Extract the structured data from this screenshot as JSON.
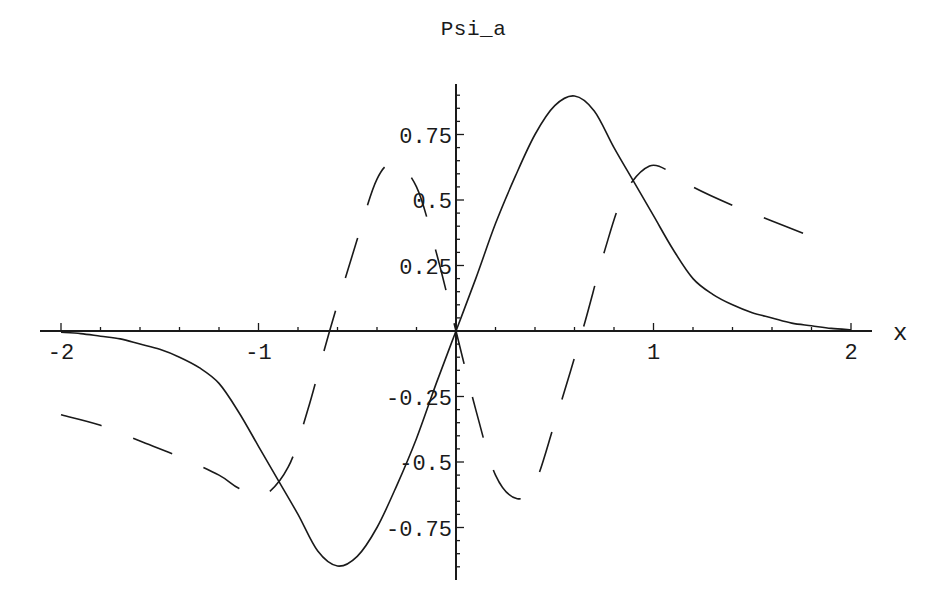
{
  "chart_data": {
    "type": "line",
    "title": "Psi_a",
    "xlabel": "x",
    "ylabel": "",
    "xlim": [
      -2.1,
      2.1
    ],
    "ylim": [
      -0.91,
      0.94
    ],
    "grid": false,
    "legend": null,
    "x_ticks": [
      {
        "value": -2,
        "label": "-2"
      },
      {
        "value": -1,
        "label": "-1"
      },
      {
        "value": 1,
        "label": "1"
      },
      {
        "value": 2,
        "label": "2"
      }
    ],
    "y_ticks": [
      {
        "value": 0.75,
        "label": "0.75"
      },
      {
        "value": 0.5,
        "label": "0.5"
      },
      {
        "value": 0.25,
        "label": "0.25"
      },
      {
        "value": -0.25,
        "label": "-0.25"
      },
      {
        "value": -0.5,
        "label": "-0.5"
      },
      {
        "value": -0.75,
        "label": "-0.75"
      }
    ],
    "series": [
      {
        "name": "solid",
        "style": "solid",
        "x": [
          -2.0,
          -1.9,
          -1.8,
          -1.7,
          -1.6,
          -1.5,
          -1.4,
          -1.3,
          -1.2,
          -1.1,
          -1.0,
          -0.9,
          -0.8,
          -0.7,
          -0.6,
          -0.5,
          -0.4,
          -0.3,
          -0.2,
          -0.1,
          0.0,
          0.1,
          0.2,
          0.3,
          0.4,
          0.5,
          0.6,
          0.7,
          0.8,
          0.9,
          1.0,
          1.1,
          1.2,
          1.3,
          1.4,
          1.5,
          1.6,
          1.7,
          1.8,
          1.9,
          2.0
        ],
        "values": [
          -0.005,
          -0.01,
          -0.02,
          -0.03,
          -0.05,
          -0.07,
          -0.1,
          -0.14,
          -0.2,
          -0.31,
          -0.44,
          -0.57,
          -0.7,
          -0.84,
          -0.897,
          -0.86,
          -0.75,
          -0.59,
          -0.41,
          -0.2,
          0.0,
          0.2,
          0.41,
          0.59,
          0.75,
          0.86,
          0.897,
          0.84,
          0.7,
          0.57,
          0.44,
          0.31,
          0.2,
          0.14,
          0.1,
          0.07,
          0.05,
          0.03,
          0.02,
          0.01,
          0.005
        ]
      },
      {
        "name": "dashed",
        "style": "dashed",
        "x": [
          -2.0,
          -1.8,
          -1.6,
          -1.4,
          -1.2,
          -1.1,
          -0.98,
          -0.85,
          -0.75,
          -0.64,
          -0.5,
          -0.4,
          -0.31,
          -0.2,
          -0.1,
          0.0,
          0.1,
          0.2,
          0.31,
          0.4,
          0.5,
          0.64,
          0.75,
          0.85,
          0.98,
          1.1,
          1.2,
          1.4,
          1.6,
          1.8
        ],
        "values": [
          -0.32,
          -0.36,
          -0.42,
          -0.48,
          -0.55,
          -0.6,
          -0.63,
          -0.52,
          -0.3,
          0.0,
          0.35,
          0.58,
          0.64,
          0.55,
          0.3,
          0.0,
          -0.3,
          -0.55,
          -0.64,
          -0.58,
          -0.35,
          0.0,
          0.3,
          0.52,
          0.63,
          0.6,
          0.55,
          0.48,
          0.42,
          0.36
        ]
      }
    ]
  },
  "layout": {
    "origin_px": [
      456,
      331
    ],
    "px_per_x": 197.5,
    "px_per_y": 262,
    "x_axis_px": [
      40,
      872
    ],
    "y_axis_px": [
      84,
      580
    ],
    "ink": "#1a1a1a"
  }
}
